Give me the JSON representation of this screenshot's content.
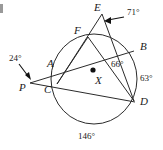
{
  "figure": {
    "corner_artifact": ""
  },
  "points": [
    {
      "id": "E",
      "label": "E",
      "x": 102,
      "y": 13,
      "label_x": 94,
      "label_y": 3,
      "on_circle": false
    },
    {
      "id": "F",
      "label": "F",
      "x": 88,
      "y": 37,
      "label_x": 76,
      "label_y": 26,
      "on_circle": true
    },
    {
      "id": "B",
      "label": "B",
      "x": 133,
      "y": 52,
      "label_x": 140,
      "label_y": 42,
      "on_circle": true
    },
    {
      "id": "A",
      "label": "A",
      "x": 62,
      "y": 69,
      "label_x": 48,
      "label_y": 58,
      "on_circle": true
    },
    {
      "id": "P",
      "label": "P",
      "x": 29,
      "y": 83,
      "label_x": 21,
      "label_y": 82,
      "on_circle": false
    },
    {
      "id": "C",
      "label": "C",
      "x": 57,
      "y": 84,
      "label_x": 45,
      "label_y": 84,
      "on_circle": true
    },
    {
      "id": "D",
      "label": "D",
      "x": 134,
      "y": 101,
      "label_x": 140,
      "label_y": 97,
      "on_circle": true
    },
    {
      "id": "X",
      "label": "X",
      "x": 93,
      "y": 70,
      "label_x": 94,
      "label_y": 76,
      "on_circle": false
    }
  ],
  "circle": {
    "center_x": 94,
    "center_y": 79,
    "radius": 43,
    "center_dot_label": "X"
  },
  "chords": [
    {
      "name": "chord-A-B",
      "from": "A",
      "to": "B"
    },
    {
      "name": "chord-F-D",
      "from": "F",
      "to": "D"
    },
    {
      "name": "chord-C-D",
      "from": "C",
      "to": "D"
    },
    {
      "name": "chord-F-C",
      "from": "F",
      "to": "C"
    }
  ],
  "secants": [
    {
      "name": "secant-E-F-C",
      "from": "E",
      "through": "F",
      "to": "C"
    },
    {
      "name": "secant-E-B-D",
      "from": "E",
      "through": "B",
      "to": "D"
    },
    {
      "name": "secant-P-A-B",
      "from": "P",
      "through": "A",
      "to": "B"
    },
    {
      "name": "secant-P-C-D",
      "from": "P",
      "through": "C",
      "to": "D"
    }
  ],
  "angles": [
    {
      "id": "angle-E",
      "value": "71°",
      "label_x": 127,
      "label_y": 11,
      "arrow_from_x": 124,
      "arrow_from_y": 17,
      "arrow_to_x": 105,
      "arrow_to_y": 21,
      "has_arrow": true
    },
    {
      "id": "angle-P",
      "value": "24°",
      "label_x": 12,
      "label_y": 57,
      "arrow_from_x": 20,
      "arrow_from_y": 65,
      "arrow_to_x": 31,
      "arrow_to_y": 79,
      "has_arrow": true
    },
    {
      "id": "angle-interior-66",
      "value": "66°",
      "label_x": 112,
      "label_y": 63,
      "has_arrow": false
    },
    {
      "id": "arc-BD-63",
      "value": "63°",
      "label_x": 141,
      "label_y": 76,
      "has_arrow": false
    },
    {
      "id": "arc-CD-146",
      "value": "146°",
      "label_x": 82,
      "label_y": 133,
      "has_arrow": false
    }
  ],
  "colors": {
    "stroke": "#2b2b2b",
    "text": "#1a1a1a",
    "background": "#ffffff"
  }
}
